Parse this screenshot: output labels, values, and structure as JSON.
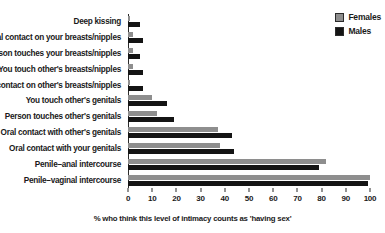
{
  "chart_data": {
    "type": "bar",
    "orientation": "horizontal",
    "title": "",
    "xlabel": "% who think this level of intimacy counts as 'having sex'",
    "ylabel": "",
    "xlim": [
      0,
      100
    ],
    "xticks": [
      0,
      10,
      20,
      30,
      40,
      50,
      60,
      70,
      80,
      90,
      100
    ],
    "grid": false,
    "legend_position": "top-right",
    "categories": [
      "Deep kissing",
      "Oral contact on your breasts/nipples",
      "Person touches your breasts/nipples",
      "You touch other's breasts/nipples",
      "Oral contact on other's breasts/nipples",
      "You touch other's genitals",
      "Person touches other's genitals",
      "Oral contact with other's genitals",
      "Oral contact with your genitals",
      "Penile–anal intercourse",
      "Penile–vaginal intercourse"
    ],
    "series": [
      {
        "name": "Females",
        "color": "#8e8e8e",
        "values": [
          1,
          2,
          2,
          2,
          1,
          10,
          12,
          37,
          38,
          82,
          100
        ]
      },
      {
        "name": "Males",
        "color": "#141414",
        "values": [
          5,
          6,
          5,
          6,
          6,
          16,
          19,
          43,
          44,
          79,
          99
        ]
      }
    ]
  },
  "legend": {
    "items": [
      {
        "label": "Females",
        "color": "#8e8e8e"
      },
      {
        "label": "Males",
        "color": "#141414"
      }
    ]
  }
}
